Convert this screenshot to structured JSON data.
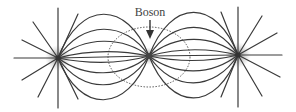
{
  "diagram": {
    "label": "Boson",
    "nodes": [
      {
        "id": "left-particle",
        "x": 58,
        "y": 58
      },
      {
        "id": "boson",
        "x": 149,
        "y": 56
      },
      {
        "id": "right-particle",
        "x": 238,
        "y": 55
      }
    ],
    "exchange_region": {
      "shape": "dotted-ellipse",
      "cx": 149,
      "cy": 57,
      "rx": 41,
      "ry": 30
    },
    "colors": {
      "line": "#3a3a3a",
      "dotted": "#555555",
      "glow": "#888888",
      "background": "#ffffff"
    }
  }
}
